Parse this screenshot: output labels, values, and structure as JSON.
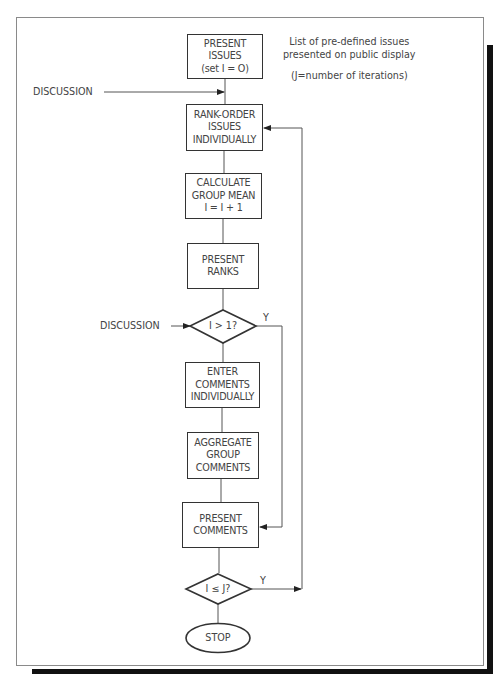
{
  "header_fragment": "",
  "flowchart": {
    "start_box": {
      "lines": [
        "PRESENT",
        "ISSUES",
        "(set I = O)"
      ]
    },
    "rank_box": {
      "lines": [
        "RANK-ORDER",
        "ISSUES",
        "INDIVIDUALLY"
      ]
    },
    "calc_box": {
      "lines": [
        "CALCULATE",
        "GROUP MEAN",
        "I = I + 1"
      ]
    },
    "ranks_box": {
      "lines": [
        "PRESENT",
        "RANKS"
      ]
    },
    "decision1": {
      "text": "I  > 1?",
      "yes_label": "Y"
    },
    "enter_box": {
      "lines": [
        "ENTER",
        "COMMENTS",
        "INDIVIDUALLY"
      ]
    },
    "aggregate_box": {
      "lines": [
        "AGGREGATE",
        "GROUP",
        "COMMENTS"
      ]
    },
    "comments_box": {
      "lines": [
        "PRESENT",
        "COMMENTS"
      ]
    },
    "decision2": {
      "text": "I ≤ J?",
      "yes_label": "Y"
    },
    "stop": {
      "text": "STOP"
    },
    "discussion_top": "DISCUSSION",
    "discussion_mid": "DISCUSSION"
  },
  "notes": {
    "issues_note": [
      "List of pre-defined issues",
      "presented on public display"
    ],
    "iterations_note": "(J=number of iterations)"
  }
}
